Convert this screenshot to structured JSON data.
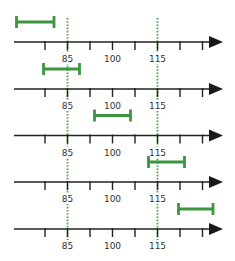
{
  "chart_data": {
    "type": "interval-diagram",
    "title": "",
    "axis": {
      "tick_values": [
        77.5,
        85,
        92.5,
        100,
        107.5,
        115,
        122.5,
        130
      ],
      "labeled_ticks": [
        "85",
        "100",
        "115"
      ],
      "range_visible": [
        68,
        133
      ],
      "arrow": "right"
    },
    "reference_lines": [
      {
        "value": 85,
        "style": "dotted",
        "color": "#4a9f4c"
      },
      {
        "value": 115,
        "style": "dotted",
        "color": "#4a9f4c"
      }
    ],
    "intervals": [
      {
        "row": 1,
        "low": 68,
        "high": 80.5
      },
      {
        "row": 2,
        "low": 77,
        "high": 89
      },
      {
        "row": 3,
        "low": 94,
        "high": 106
      },
      {
        "row": 4,
        "low": 112,
        "high": 124
      },
      {
        "row": 5,
        "low": 122,
        "high": 133.5
      }
    ],
    "colors": {
      "interval": "#3c963f",
      "axis": "#222222",
      "label": "#333333"
    }
  },
  "labels": {
    "l85": "85",
    "l100": "100",
    "l115": "115"
  }
}
